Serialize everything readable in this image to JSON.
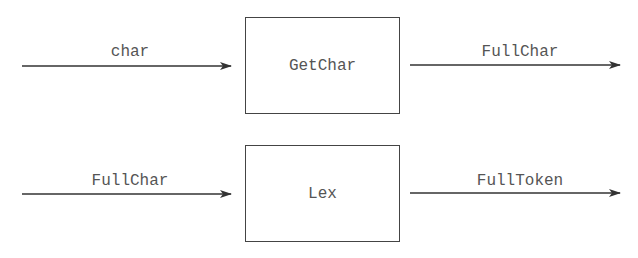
{
  "diagram": {
    "rows": [
      {
        "input_label": "char",
        "box_label": "GetChar",
        "output_label": "FullChar"
      },
      {
        "input_label": "FullChar",
        "box_label": "Lex",
        "output_label": "FullToken"
      }
    ],
    "colors": {
      "line": "#333333",
      "text": "#555555",
      "box_border": "#444444",
      "background": "#ffffff"
    }
  }
}
